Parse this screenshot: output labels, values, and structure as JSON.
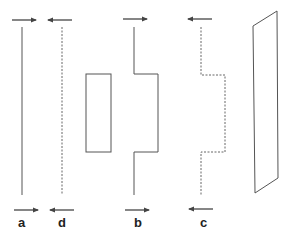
{
  "diagram": {
    "line_color": "#444444",
    "labels": {
      "a": "a",
      "d": "d",
      "b": "b",
      "c": "c"
    },
    "elements": [
      {
        "id": "a",
        "style": "solid",
        "shape": "straight-line",
        "top_arrow": "right",
        "bottom_arrow": "right"
      },
      {
        "id": "d",
        "style": "dashed",
        "shape": "straight-line",
        "top_arrow": "left",
        "bottom_arrow": "left"
      },
      {
        "id": "rect",
        "style": "solid",
        "shape": "rectangle"
      },
      {
        "id": "b",
        "style": "solid",
        "shape": "stepped-line",
        "top_arrow": "right",
        "bottom_arrow": "right"
      },
      {
        "id": "c",
        "style": "dashed",
        "shape": "stepped-line",
        "top_arrow": "left",
        "bottom_arrow": "left"
      },
      {
        "id": "parallelogram",
        "style": "solid",
        "shape": "parallelogram"
      }
    ]
  }
}
